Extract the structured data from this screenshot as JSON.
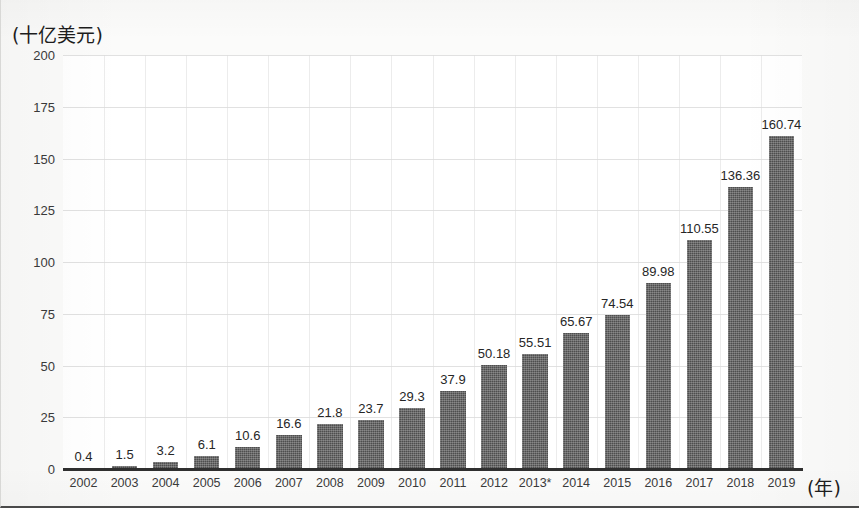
{
  "chart_data": {
    "type": "bar",
    "title": "",
    "subtitle": "",
    "ylabel": "(十亿美元)",
    "xlabel": "(年)",
    "categories": [
      "2002",
      "2003",
      "2004",
      "2005",
      "2006",
      "2007",
      "2008",
      "2009",
      "2010",
      "2011",
      "2012",
      "2013*",
      "2014",
      "2015",
      "2016",
      "2017",
      "2018",
      "2019"
    ],
    "values": [
      0.4,
      1.5,
      3.2,
      6.1,
      10.6,
      16.6,
      21.8,
      23.7,
      29.3,
      37.9,
      50.18,
      55.51,
      65.67,
      74.54,
      89.98,
      110.55,
      136.36,
      160.74
    ],
    "value_labels": [
      "0.4",
      "1.5",
      "3.2",
      "6.1",
      "10.6",
      "16.6",
      "21.8",
      "23.7",
      "29.3",
      "37.9",
      "50.18",
      "55.51",
      "65.67",
      "74.54",
      "89.98",
      "110.55",
      "136.36",
      "160.74"
    ],
    "ylim": [
      0,
      200
    ],
    "yticks": [
      0,
      25,
      50,
      75,
      100,
      125,
      150,
      175,
      200
    ],
    "ytick_labels": [
      "0",
      "25",
      "50",
      "75",
      "100",
      "125",
      "150",
      "175",
      "200"
    ],
    "grid": "horizontal-and-vertical",
    "legend": "none",
    "bar_color": "#4e4e4e",
    "gridline_color": "#dcdcdc",
    "axis_color": "#2f2f2f",
    "text_color": "#262626",
    "annotations": [
      "2013*"
    ]
  }
}
